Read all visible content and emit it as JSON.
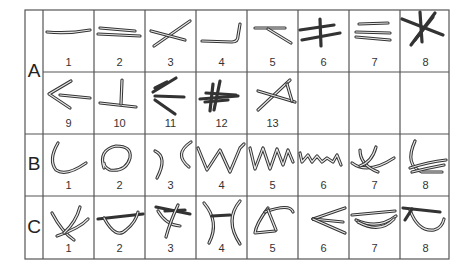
{
  "figure": {
    "type": "classification-table",
    "rows": [
      {
        "label": "A",
        "cells": [
          {
            "number": "1",
            "shape": "single-straight"
          },
          {
            "number": "2",
            "shape": "two-parallel"
          },
          {
            "number": "3",
            "shape": "x-cross"
          },
          {
            "number": "4",
            "shape": "l-bend"
          },
          {
            "number": "5",
            "shape": "v-angle-open-left"
          },
          {
            "number": "6",
            "shape": "hash-two-parallel-one-cross"
          },
          {
            "number": "7",
            "shape": "three-parallel"
          },
          {
            "number": "8",
            "shape": "star-multiple-cross"
          },
          {
            "number": "9",
            "shape": "arrow-v-with-bar"
          },
          {
            "number": "10",
            "shape": "inverted-t"
          },
          {
            "number": "11",
            "shape": "fan-converging-left"
          },
          {
            "number": "12",
            "shape": "hash-tangle"
          },
          {
            "number": "13",
            "shape": "triangle-crossed"
          }
        ]
      },
      {
        "label": "B",
        "cells": [
          {
            "number": "1",
            "shape": "j-curve"
          },
          {
            "number": "2",
            "shape": "loop"
          },
          {
            "number": "3",
            "shape": "double-parenthesis"
          },
          {
            "number": "4",
            "shape": "w-wave"
          },
          {
            "number": "5",
            "shape": "zigzag-large"
          },
          {
            "number": "6",
            "shape": "zigzag-small"
          },
          {
            "number": "7",
            "shape": "curved-cross"
          },
          {
            "number": "8",
            "shape": "curved-bundle"
          }
        ]
      },
      {
        "label": "C",
        "cells": [
          {
            "number": "1",
            "shape": "crossed-arcs"
          },
          {
            "number": "2",
            "shape": "bowl-with-bar"
          },
          {
            "number": "3",
            "shape": "arc-with-cross-bars"
          },
          {
            "number": "4",
            "shape": "opposed-arcs-with-bar"
          },
          {
            "number": "5",
            "shape": "sail-arc"
          },
          {
            "number": "6",
            "shape": "fan-three"
          },
          {
            "number": "7",
            "shape": "parallel-arcs-bundle"
          },
          {
            "number": "8",
            "shape": "arc-hanging-from-bar"
          }
        ]
      }
    ]
  },
  "colors": {
    "grid": "#555555",
    "rod": "#333333",
    "background": "#ffffff"
  }
}
